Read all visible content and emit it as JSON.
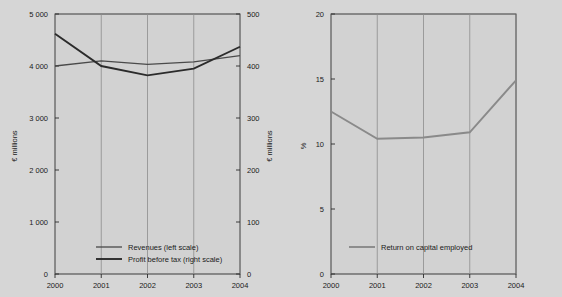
{
  "figure": {
    "background_color": "#d6d6d6",
    "plot_background_color": "#d2d2d2",
    "axis_color": "#2b2b2b",
    "gridline_color": "#8d8d8d"
  },
  "chart_data": [
    {
      "id": "revenues-profit-chart",
      "type": "line",
      "title": "",
      "xlabel": "",
      "ylabel": "€ millions",
      "y2label": "€ millions",
      "x": [
        "2000",
        "2001",
        "2002",
        "2003",
        "2004"
      ],
      "categories": [
        "2000",
        "2001",
        "2002",
        "2003",
        "2004"
      ],
      "ylim": [
        0,
        5000
      ],
      "y2lim": [
        0,
        500
      ],
      "yticks": [
        0,
        1000,
        2000,
        3000,
        4000,
        5000
      ],
      "ytick_labels": [
        "0",
        "1 000",
        "2 000",
        "3 000",
        "4 000",
        "5 000"
      ],
      "y2ticks": [
        0,
        100,
        200,
        300,
        400,
        500
      ],
      "y2tick_labels": [
        "0",
        "100",
        "200",
        "300",
        "400",
        "500"
      ],
      "grid": true,
      "grid_axis": "x",
      "legend_position": "bottom-center",
      "series": [
        {
          "name": "Revenues (left scale)",
          "axis": "left",
          "color": "#4a4a4a",
          "line_width": 1.3,
          "values": [
            4000,
            4100,
            4030,
            4080,
            4200
          ]
        },
        {
          "name": "Profit before tax (right scale)",
          "axis": "right",
          "color": "#2b2b2b",
          "line_width": 1.9,
          "values": [
            462,
            400,
            382,
            395,
            437
          ]
        }
      ]
    },
    {
      "id": "roce-chart",
      "type": "line",
      "title": "",
      "xlabel": "",
      "ylabel": "%",
      "x": [
        "2000",
        "2001",
        "2002",
        "2003",
        "2004"
      ],
      "categories": [
        "2000",
        "2001",
        "2002",
        "2003",
        "2004"
      ],
      "ylim": [
        0,
        20
      ],
      "yticks": [
        0,
        5,
        10,
        15,
        20
      ],
      "ytick_labels": [
        "0",
        "5",
        "10",
        "15",
        "20"
      ],
      "grid": true,
      "grid_axis": "x",
      "legend_position": "bottom-center",
      "series": [
        {
          "name": "Return on capital employed",
          "axis": "left",
          "color": "#8a8a8a",
          "line_width": 1.9,
          "values": [
            12.5,
            10.4,
            10.5,
            10.9,
            14.9
          ]
        }
      ]
    }
  ]
}
